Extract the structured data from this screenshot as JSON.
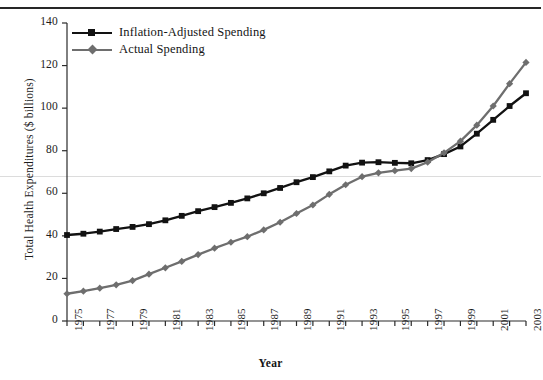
{
  "chart_data": {
    "type": "line",
    "title": "",
    "xlabel": "Year",
    "ylabel": "Total Health Expenditures ($ billions)",
    "xlim": [
      1975,
      2003
    ],
    "ylim": [
      0,
      140
    ],
    "ytick_values": [
      0,
      20,
      40,
      60,
      80,
      100,
      120,
      140
    ],
    "ytick_labels": [
      "0",
      "20",
      "40",
      "60",
      "80",
      "100",
      "120",
      "140"
    ],
    "xtick_values": [
      1975,
      1976,
      1977,
      1978,
      1979,
      1980,
      1981,
      1982,
      1983,
      1984,
      1985,
      1986,
      1987,
      1988,
      1989,
      1990,
      1991,
      1992,
      1993,
      1994,
      1995,
      1996,
      1997,
      1998,
      1999,
      2000,
      2001,
      2002,
      2003
    ],
    "xtick_labels_shown": [
      "1975",
      "1977",
      "1979",
      "1981",
      "1983",
      "1985",
      "1987",
      "1989",
      "1991",
      "1993",
      "1995",
      "1997",
      "1999",
      "2001",
      "2003"
    ],
    "grid": false,
    "legend_position": "top-left",
    "x": [
      1975,
      1976,
      1977,
      1978,
      1979,
      1980,
      1981,
      1982,
      1983,
      1984,
      1985,
      1986,
      1987,
      1988,
      1989,
      1990,
      1991,
      1992,
      1993,
      1994,
      1995,
      1996,
      1997,
      1998,
      1999,
      2000,
      2001,
      2002,
      2003
    ],
    "series": [
      {
        "name": "Inflation-Adjusted Spending",
        "color": "#121212",
        "marker": "square",
        "values": [
          40.4,
          41.0,
          42.0,
          43.2,
          44.2,
          45.5,
          47.3,
          49.4,
          51.6,
          53.5,
          55.5,
          57.6,
          60.0,
          62.5,
          65.2,
          67.6,
          70.3,
          73.0,
          74.4,
          74.6,
          74.3,
          74.1,
          75.6,
          78.4,
          82.0,
          88.0,
          94.5,
          101.0,
          107.0
        ]
      },
      {
        "name": "Actual Spending",
        "color": "#6e6e6e",
        "marker": "diamond",
        "values": [
          12.8,
          14.0,
          15.4,
          17.0,
          19.0,
          22.0,
          25.0,
          28.0,
          31.2,
          34.2,
          37.0,
          39.6,
          42.8,
          46.4,
          50.5,
          54.5,
          59.5,
          64.0,
          67.8,
          69.6,
          70.6,
          71.6,
          74.6,
          79.0,
          84.5,
          92.0,
          101.0,
          111.5,
          121.5
        ]
      }
    ]
  },
  "legend": {
    "items": [
      {
        "label": "Inflation-Adjusted Spending"
      },
      {
        "label": "Actual Spending"
      }
    ]
  },
  "axes": {
    "x_title": "Year",
    "y_title": "Total Health Expenditures ($ billions)"
  }
}
